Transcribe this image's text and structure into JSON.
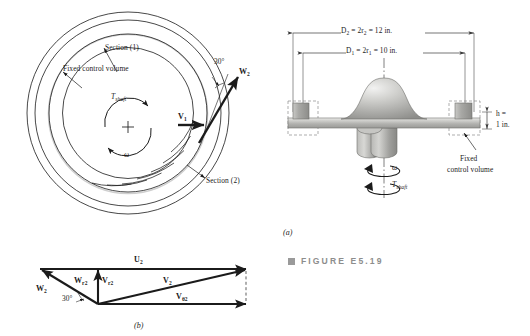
{
  "figure": {
    "caption_label": "FIGURE E5.19",
    "caption_bullet": "square-bullet",
    "panel_a_letter": "(a)",
    "panel_b_letter": "(b)"
  },
  "plan_view": {
    "annotations": [
      {
        "id": "section-1",
        "text": "Section (1)"
      },
      {
        "id": "fixed-control-volume",
        "text": "Fixed control volume"
      },
      {
        "id": "section-2",
        "text": "Section (2)"
      }
    ],
    "torque_label": {
      "main": "T",
      "sub": "shaft"
    },
    "omega_label": "ω",
    "plus_marker": "+",
    "angle_label": "30°",
    "vectors": [
      {
        "id": "W2",
        "main": "W",
        "sub": "2"
      },
      {
        "id": "V1",
        "main": "V",
        "sub": "1"
      }
    ]
  },
  "section_view": {
    "dimensions": [
      {
        "id": "outer-diameter",
        "text": "D₂ = 2r₂ = 12 in.",
        "symbol": "D",
        "sub": "2",
        "radius_symbol": "r",
        "radius_sub": "2",
        "value": "12 in."
      },
      {
        "id": "inner-diameter",
        "text": "D₁ = 2r₁ = 10 in.",
        "symbol": "D",
        "sub": "1",
        "radius_symbol": "r",
        "radius_sub": "1",
        "value": "10 in."
      }
    ],
    "height_label_line1": "h =",
    "height_label_line2": "1 in.",
    "omega_label": "ω",
    "torque_label": {
      "main": "T",
      "sub": "shaft"
    },
    "control_volume_label_line1": "Fixed",
    "control_volume_label_line2": "control volume"
  },
  "velocity_triangle": {
    "angle_label": "30°",
    "vectors": [
      {
        "id": "U2",
        "main": "U",
        "sub": "2"
      },
      {
        "id": "W2",
        "main": "W",
        "sub": "2"
      },
      {
        "id": "Wr2",
        "main": "W",
        "sub": "r2"
      },
      {
        "id": "Vr2",
        "main": "V",
        "sub": "r2"
      },
      {
        "id": "V2",
        "main": "V",
        "sub": "2"
      },
      {
        "id": "Vtheta2",
        "main": "V",
        "sub": "θ2"
      }
    ]
  },
  "colors": {
    "line": "#1b1b1b",
    "caption": "#8d8d8d",
    "bullet": "#9a9a9a",
    "metal_light": "#e2e2e0",
    "metal_mid": "#b9b9b6",
    "metal_dark": "#8e8e8c",
    "dashed_box": "#8a8a8a"
  }
}
